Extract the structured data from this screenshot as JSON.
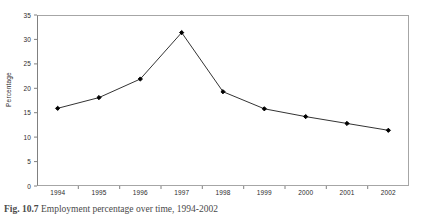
{
  "figure": {
    "caption_label": "Fig. 10.7",
    "caption_text": "Employment percentage over time, 1994-2002"
  },
  "chart_data": {
    "type": "line",
    "title": "",
    "subtitle": "",
    "xlabel": "",
    "ylabel": "Percentage",
    "categories": [
      "1994",
      "1995",
      "1996",
      "1997",
      "1998",
      "1999",
      "2000",
      "2001",
      "2002"
    ],
    "values": [
      15.9,
      18.1,
      21.9,
      31.4,
      19.3,
      15.8,
      14.2,
      12.8,
      11.4
    ],
    "series": [
      {
        "name": "Percentage",
        "values": [
          15.9,
          18.1,
          21.9,
          31.4,
          19.3,
          15.8,
          14.2,
          12.8,
          11.4
        ]
      }
    ],
    "ylim": [
      0,
      35
    ],
    "ytick_values": [
      0,
      5,
      10,
      15,
      20,
      25,
      30,
      35
    ],
    "ytick_labels": [
      "0",
      "5",
      "10",
      "15",
      "20",
      "25",
      "30",
      "35"
    ],
    "xtick_labels": [
      "1994",
      "1995",
      "1996",
      "1997",
      "1998",
      "1999",
      "2000",
      "2001",
      "2002"
    ],
    "grid": false,
    "legend": false,
    "legend_position": "none",
    "marker": "filled-diamond",
    "line_color": "#333333",
    "marker_color": "#000000",
    "plot_background": "#ffffff",
    "axis_color": "#a6a6a6"
  }
}
